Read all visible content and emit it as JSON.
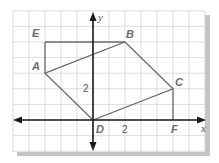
{
  "diagram": {
    "type": "coordinate-plane-polygon",
    "grid": {
      "x_min": -5,
      "x_max": 7,
      "y_min": -2,
      "y_max": 7,
      "unit_px_x": 16,
      "unit_px_y": 15.6,
      "origin_px": [
        93,
        120
      ],
      "line_color": "#d4d4d4",
      "shadow_color": "#bdbdbd"
    },
    "axes": {
      "x_label": "x",
      "y_label": "y",
      "color": "#1a1a1a"
    },
    "tick_labels": {
      "x": "2",
      "y": "2"
    },
    "polygon": {
      "vertices_order": [
        "A",
        "B",
        "C",
        "D"
      ],
      "stroke": "#6b6b6b"
    },
    "extra_segments": [
      [
        "A",
        "E"
      ],
      [
        "E",
        "B"
      ],
      [
        "C",
        "F"
      ]
    ],
    "points": [
      {
        "name": "A",
        "x": -3,
        "y": 3
      },
      {
        "name": "B",
        "x": 2,
        "y": 5
      },
      {
        "name": "C",
        "x": 5,
        "y": 2
      },
      {
        "name": "D",
        "x": 0,
        "y": 0
      },
      {
        "name": "E",
        "x": -3,
        "y": 5
      },
      {
        "name": "F",
        "x": 5,
        "y": 0
      }
    ],
    "labels": {
      "A": "A",
      "B": "B",
      "C": "C",
      "D": "D",
      "E": "E",
      "F": "F"
    }
  }
}
